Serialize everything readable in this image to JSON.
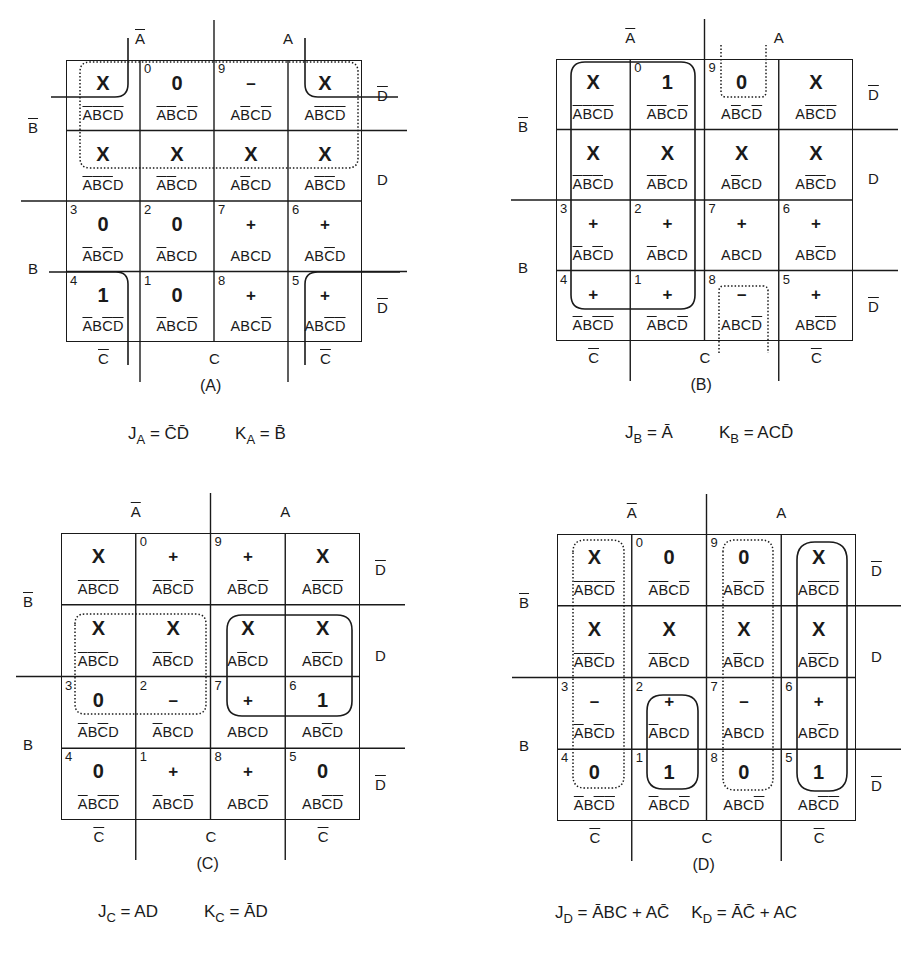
{
  "figure": {
    "maps": [
      {
        "id": "A",
        "caption": "(A)",
        "labels": {
          "a_bar": "A",
          "a": "A",
          "b_bar": "B",
          "b": "B",
          "c_bar_left": "C",
          "c": "C",
          "c_bar_right": "C",
          "d_bar_top": "D",
          "d": "D",
          "d_bar_bottom": "D"
        },
        "cells": [
          [
            {
              "num": "",
              "val": "X"
            },
            {
              "num": "0",
              "val": "0"
            },
            {
              "num": "9",
              "val": "–"
            },
            {
              "num": "",
              "val": "X"
            }
          ],
          [
            {
              "num": "",
              "val": "X"
            },
            {
              "num": "",
              "val": "X"
            },
            {
              "num": "",
              "val": "X"
            },
            {
              "num": "",
              "val": "X"
            }
          ],
          [
            {
              "num": "3",
              "val": "0"
            },
            {
              "num": "2",
              "val": "0"
            },
            {
              "num": "7",
              "val": "+"
            },
            {
              "num": "6",
              "val": "+"
            }
          ],
          [
            {
              "num": "4",
              "val": "1"
            },
            {
              "num": "1",
              "val": "0"
            },
            {
              "num": "8",
              "val": "+"
            },
            {
              "num": "5",
              "val": "+"
            }
          ]
        ],
        "equation": {
          "j_name": "J",
          "j_sub": "A",
          "j_expr": "C̄D̄",
          "k_name": "K",
          "k_sub": "A",
          "k_expr": "B̄"
        }
      },
      {
        "id": "B",
        "caption": "(B)",
        "labels": {
          "a_bar": "A",
          "a": "A",
          "b_bar": "B",
          "b": "B",
          "c_bar_left": "C",
          "c": "C",
          "c_bar_right": "C",
          "d_bar_top": "D",
          "d": "D",
          "d_bar_bottom": "D"
        },
        "cells": [
          [
            {
              "num": "",
              "val": "X"
            },
            {
              "num": "0",
              "val": "1"
            },
            {
              "num": "9",
              "val": "0"
            },
            {
              "num": "",
              "val": "X"
            }
          ],
          [
            {
              "num": "",
              "val": "X"
            },
            {
              "num": "",
              "val": "X"
            },
            {
              "num": "",
              "val": "X"
            },
            {
              "num": "",
              "val": "X"
            }
          ],
          [
            {
              "num": "3",
              "val": "+"
            },
            {
              "num": "2",
              "val": "+"
            },
            {
              "num": "7",
              "val": "+"
            },
            {
              "num": "6",
              "val": "+"
            }
          ],
          [
            {
              "num": "4",
              "val": "+"
            },
            {
              "num": "1",
              "val": "+"
            },
            {
              "num": "8",
              "val": "–"
            },
            {
              "num": "5",
              "val": "+"
            }
          ]
        ],
        "equation": {
          "j_name": "J",
          "j_sub": "B",
          "j_expr": "Ā",
          "k_name": "K",
          "k_sub": "B",
          "k_expr": "ACD̄"
        }
      },
      {
        "id": "C",
        "caption": "(C)",
        "labels": {
          "a_bar": "A",
          "a": "A",
          "b_bar": "B",
          "b": "B",
          "c_bar_left": "C",
          "c": "C",
          "c_bar_right": "C",
          "d_bar_top": "D",
          "d": "D",
          "d_bar_bottom": "D"
        },
        "cells": [
          [
            {
              "num": "",
              "val": "X"
            },
            {
              "num": "0",
              "val": "+"
            },
            {
              "num": "9",
              "val": "+"
            },
            {
              "num": "",
              "val": "X"
            }
          ],
          [
            {
              "num": "",
              "val": "X"
            },
            {
              "num": "",
              "val": "X"
            },
            {
              "num": "",
              "val": "X"
            },
            {
              "num": "",
              "val": "X"
            }
          ],
          [
            {
              "num": "3",
              "val": "0"
            },
            {
              "num": "2",
              "val": "–"
            },
            {
              "num": "7",
              "val": "+"
            },
            {
              "num": "6",
              "val": "1"
            }
          ],
          [
            {
              "num": "4",
              "val": "0"
            },
            {
              "num": "1",
              "val": "+"
            },
            {
              "num": "8",
              "val": "+"
            },
            {
              "num": "5",
              "val": "0"
            }
          ]
        ],
        "equation": {
          "j_name": "J",
          "j_sub": "C",
          "j_expr": "AD",
          "k_name": "K",
          "k_sub": "C",
          "k_expr": "ĀD"
        }
      },
      {
        "id": "D",
        "caption": "(D)",
        "labels": {
          "a_bar": "A",
          "a": "A",
          "b_bar": "B",
          "b": "B",
          "c_bar_left": "C",
          "c": "C",
          "c_bar_right": "C",
          "d_bar_top": "D",
          "d": "D",
          "d_bar_bottom": "D"
        },
        "cells": [
          [
            {
              "num": "",
              "val": "X"
            },
            {
              "num": "0",
              "val": "0"
            },
            {
              "num": "9",
              "val": "0"
            },
            {
              "num": "",
              "val": "X"
            }
          ],
          [
            {
              "num": "",
              "val": "X"
            },
            {
              "num": "",
              "val": "X"
            },
            {
              "num": "",
              "val": "X"
            },
            {
              "num": "",
              "val": "X"
            }
          ],
          [
            {
              "num": "3",
              "val": "–"
            },
            {
              "num": "2",
              "val": "+"
            },
            {
              "num": "7",
              "val": "–"
            },
            {
              "num": "6",
              "val": "+"
            }
          ],
          [
            {
              "num": "4",
              "val": "0"
            },
            {
              "num": "1",
              "val": "1"
            },
            {
              "num": "8",
              "val": "0"
            },
            {
              "num": "5",
              "val": "1"
            }
          ]
        ],
        "equation": {
          "j_name": "J",
          "j_sub": "D",
          "j_expr": "ĀBC + AC̄",
          "k_name": "K",
          "k_sub": "D",
          "k_expr": "ĀC̄ + AC"
        }
      }
    ],
    "minterm_terms": {
      "row0": [
        [
          "A",
          "B",
          "C",
          "D"
        ],
        [
          "A",
          "B",
          "C",
          "D"
        ],
        [
          "A",
          "B",
          "C",
          "D"
        ],
        [
          "A",
          "B",
          "C",
          "D"
        ]
      ],
      "bars": [
        [
          [
            1,
            1,
            1,
            1
          ],
          [
            1,
            1,
            0,
            1
          ],
          [
            0,
            1,
            0,
            1
          ],
          [
            0,
            1,
            1,
            1
          ]
        ],
        [
          [
            1,
            1,
            1,
            0
          ],
          [
            1,
            1,
            0,
            0
          ],
          [
            0,
            1,
            0,
            0
          ],
          [
            0,
            1,
            1,
            0
          ]
        ],
        [
          [
            1,
            0,
            1,
            0
          ],
          [
            1,
            0,
            0,
            0
          ],
          [
            0,
            0,
            0,
            0
          ],
          [
            0,
            0,
            1,
            0
          ]
        ],
        [
          [
            1,
            0,
            1,
            1
          ],
          [
            1,
            0,
            0,
            1
          ],
          [
            0,
            0,
            0,
            1
          ],
          [
            0,
            0,
            1,
            1
          ]
        ]
      ]
    }
  }
}
